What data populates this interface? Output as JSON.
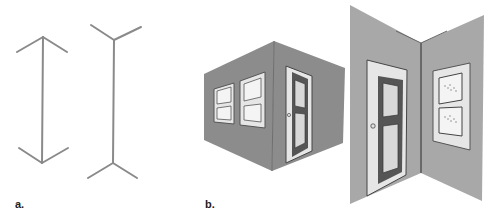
{
  "figure": {
    "panels": [
      {
        "id": "a",
        "label": "a.",
        "description": "Müller-Lyer line figures: arrowhead-ended line and fin-ended line"
      },
      {
        "id": "b",
        "label": "b.",
        "description": "Room corner illustrations: outside corner with pictures and door, inside corner with door and pictures"
      }
    ]
  },
  "colors": {
    "line": "#8a8a8a",
    "wall": "#8c8c8c",
    "wall_light": "#a8a8a8",
    "frame_light": "#e6e6e6",
    "door_dark": "#555555",
    "outline": "#4a4a4a",
    "background": "#ffffff"
  }
}
